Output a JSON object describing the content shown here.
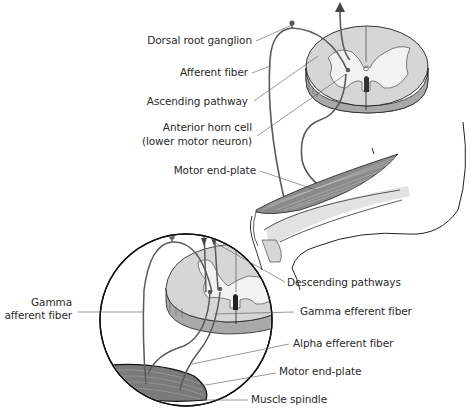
{
  "diagram": {
    "type": "anatomical-illustration",
    "colors": {
      "gray_matter": "#f2f2f2",
      "white_matter": "#d6d6d6",
      "cut_edge": "#a9a9a9",
      "fiber": "#5a5a5a",
      "outline": "#222222",
      "leader": "#555555"
    },
    "labels": {
      "dorsal_root_ganglion": "Dorsal root ganglion",
      "afferent_fiber": "Afferent fiber",
      "ascending_pathway": "Ascending pathway",
      "anterior_horn_cell_1": "Anterior horn cell",
      "anterior_horn_cell_2": "(lower motor neuron)",
      "motor_end_plate_top": "Motor end-plate",
      "descending_pathways": "Descending pathways",
      "gamma_afferent_1": "Gamma",
      "gamma_afferent_2": "afferent fiber",
      "gamma_efferent": "Gamma efferent fiber",
      "alpha_efferent": "Alpha efferent fiber",
      "motor_end_plate_bottom": "Motor end-plate",
      "muscle_spindle": "Muscle spindle"
    }
  }
}
